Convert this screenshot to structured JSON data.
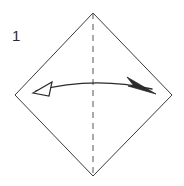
{
  "diagram": {
    "step_number": "1",
    "canvas": {
      "width": 184,
      "height": 186,
      "background": "#ffffff"
    },
    "colors": {
      "outline": "#3a3a3a",
      "crease": "#555555",
      "arrow": "#2b2b2b",
      "label": "#2b2b2b",
      "paper_fill": "#ffffff"
    },
    "paper": {
      "name": "square-sheet-rotated-diamond",
      "shape": "diamond",
      "vertices": {
        "top": {
          "x": 93,
          "y": 13
        },
        "right": {
          "x": 172,
          "y": 95
        },
        "bottom": {
          "x": 93,
          "y": 176
        },
        "left": {
          "x": 15,
          "y": 95
        }
      },
      "stroke_width": 1
    },
    "crease_line": {
      "name": "vertical-valley-crease",
      "style": "dashed",
      "x": 93,
      "y_start": 13,
      "y_end": 176,
      "dash_pattern": "6 5",
      "stroke_width": 1
    },
    "fold_arrow": {
      "name": "double-headed-fold-arrow",
      "style": "curved-double-headed",
      "path": "M 36 91 Q 93 76 152 89",
      "left_head": {
        "type": "hollow-triangle",
        "tip": {
          "x": 33,
          "y": 93
        },
        "points": "33,93 52,82 49,96"
      },
      "right_head": {
        "type": "slim-barb",
        "tip": {
          "x": 156,
          "y": 94
        },
        "points": "156,94 128,78 133,85 129,87"
      },
      "stroke_width": 1.3
    },
    "label": {
      "name": "step-number-label",
      "text": "1",
      "x": 12,
      "y": 41
    }
  }
}
